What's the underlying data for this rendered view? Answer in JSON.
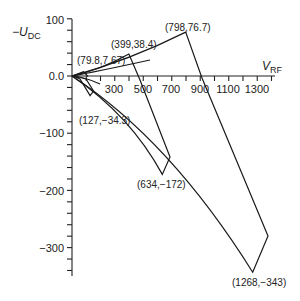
{
  "chart_data": {
    "type": "line",
    "title": "",
    "xlabel": "V_RF",
    "ylabel": "-U_DC",
    "xlim": [
      0,
      1400
    ],
    "ylim": [
      -350,
      100
    ],
    "x_ticks": [
      300,
      500,
      700,
      900,
      1100,
      1300
    ],
    "y_ticks": [
      100,
      0.0,
      -100,
      -200,
      -300
    ],
    "y_tick_labels": [
      "100",
      "0.0",
      "−100",
      "−200",
      "−300"
    ],
    "x_tick_labels": [
      "300",
      "500",
      "700",
      "900",
      "1100",
      "1300"
    ],
    "grid": false,
    "legend": null,
    "series": [
      {
        "name": "stability-region-1",
        "apex_upper": {
          "x": 79.8,
          "y": 7.67,
          "label": "(79.8,7.67)"
        },
        "apex_lower": {
          "x": 127,
          "y": -34.3,
          "label": "(127,−34.3)"
        }
      },
      {
        "name": "stability-region-2",
        "apex_upper": {
          "x": 399,
          "y": 38.4,
          "label": "(399,38.4)"
        },
        "apex_lower": {
          "x": 634,
          "y": -172,
          "label": "(634,−172)"
        }
      },
      {
        "name": "stability-region-3",
        "apex_upper": {
          "x": 798,
          "y": 76.7,
          "label": "(798,76.7)"
        },
        "apex_lower": {
          "x": 1268,
          "y": -343,
          "label": "(1268,−343)"
        }
      }
    ],
    "annotations": [
      "(79.8,7.67)",
      "(127,−34.3)",
      "(399,38.4)",
      "(634,−172)",
      "(798,76.7)",
      "(1268,−343)"
    ]
  },
  "axes": {
    "y_label_main": "−U",
    "y_label_sub": "DC",
    "x_label_main": "V",
    "x_label_sub": "RF"
  }
}
